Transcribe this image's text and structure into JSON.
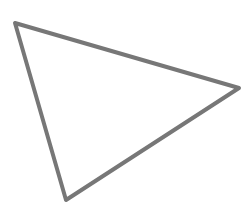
{
  "diagram": {
    "shape": "triangle",
    "vertices": [
      {
        "x": 15,
        "y": 23
      },
      {
        "x": 239,
        "y": 88
      },
      {
        "x": 66,
        "y": 200
      }
    ],
    "stroke_color": "#777777",
    "stroke_width": 4,
    "fill_color": "none",
    "background_color": "#ffffff"
  }
}
